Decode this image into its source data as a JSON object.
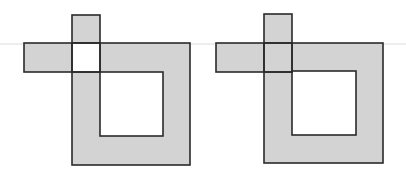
{
  "diagram": {
    "colors": {
      "fill": "#d3d3d3",
      "stroke": "#2a2a2a",
      "background": "#ffffff",
      "scan_line": "#d8d8d8"
    },
    "figures": [
      {
        "id": "left",
        "outer_square": {
          "x": 72,
          "y": 43,
          "w": 118,
          "h": 122
        },
        "inner_hole": {
          "x": 100,
          "y": 72,
          "w": 63,
          "h": 64
        },
        "vertical_bar": {
          "x": 72,
          "y": 15,
          "w": 28,
          "h": 57
        },
        "horizontal_bar": {
          "x": 24,
          "y": 43,
          "w": 76,
          "h": 29
        },
        "intersection_filled": false
      },
      {
        "id": "right",
        "outer_square": {
          "x": 264,
          "y": 43,
          "w": 119,
          "h": 120
        },
        "inner_hole": {
          "x": 292,
          "y": 71,
          "w": 64,
          "h": 64
        },
        "vertical_bar": {
          "x": 264,
          "y": 14,
          "w": 28,
          "h": 58
        },
        "horizontal_bar": {
          "x": 216,
          "y": 43,
          "w": 76,
          "h": 29
        },
        "intersection_filled": true
      }
    ]
  }
}
